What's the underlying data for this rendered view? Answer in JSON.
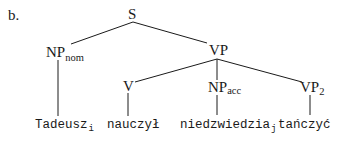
{
  "example": {
    "label": "b."
  },
  "nodes": {
    "S": {
      "label": "S"
    },
    "NP_nom": {
      "label": "NP",
      "subscript": "nom"
    },
    "VP": {
      "label": "VP"
    },
    "V": {
      "label": "V"
    },
    "NP_acc": {
      "label": "NP",
      "subscript": "acc"
    },
    "VP2": {
      "label": "VP",
      "subscript": "2"
    }
  },
  "leaves": {
    "tadeusz": {
      "text": "Tadeusz",
      "index": "i"
    },
    "nauczyl": {
      "text": "nauczył"
    },
    "niedzwiedzia": {
      "text": "niedzwiedzia",
      "index": "j"
    },
    "tanczyc": {
      "text": "tańczyć"
    }
  },
  "edges": [
    {
      "from": "S",
      "to": "NP_nom"
    },
    {
      "from": "S",
      "to": "VP"
    },
    {
      "from": "NP_nom",
      "to": "tadeusz"
    },
    {
      "from": "VP",
      "to": "V"
    },
    {
      "from": "VP",
      "to": "NP_acc"
    },
    {
      "from": "VP",
      "to": "VP2"
    },
    {
      "from": "V",
      "to": "nauczyl"
    },
    {
      "from": "NP_acc",
      "to": "niedzwiedzia"
    },
    {
      "from": "VP2",
      "to": "tanczyc"
    }
  ],
  "colors": {
    "ink": "#1a1a1a",
    "background": "#ffffff"
  }
}
